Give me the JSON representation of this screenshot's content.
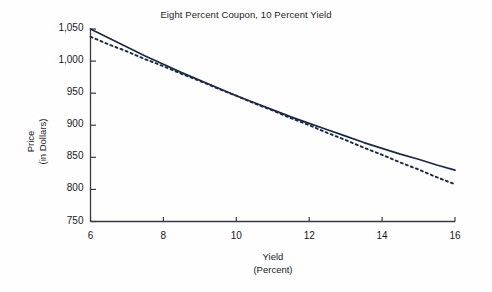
{
  "chart_data": {
    "type": "line",
    "title": "Eight Percent Coupon, 10 Percent Yield",
    "xlabel_line1": "Yield",
    "xlabel_line2": "(Percent)",
    "ylabel_line1": "Price",
    "ylabel_line2": "(in Dollars)",
    "xlim": [
      6,
      16
    ],
    "ylim": [
      750,
      1050
    ],
    "grid": false,
    "legend": "none",
    "xticks": [
      6,
      8,
      10,
      12,
      14,
      16
    ],
    "xtick_labels": [
      "6",
      "8",
      "10",
      "12",
      "14",
      "16"
    ],
    "yticks": [
      750,
      800,
      850,
      900,
      950,
      1000,
      1050
    ],
    "ytick_labels": [
      "750",
      "800",
      "850",
      "900",
      "950",
      "1,000",
      "1,050"
    ],
    "series": [
      {
        "name": "price-yield-curve",
        "style": "solid",
        "color": "#1b2a44",
        "x": [
          6,
          6.5,
          7,
          7.5,
          8,
          8.5,
          9,
          9.5,
          10,
          10.5,
          11,
          11.5,
          12,
          12.5,
          13,
          13.5,
          14,
          14.5,
          15,
          15.5,
          16
        ],
        "y": [
          1050,
          1036,
          1022,
          1008,
          995,
          982,
          970,
          958,
          946,
          935,
          924,
          913,
          903,
          893,
          883,
          873,
          864,
          855,
          847,
          838,
          830
        ]
      },
      {
        "name": "duration-approximation",
        "style": "dashed",
        "color": "#1b2a44",
        "x": [
          6,
          6.5,
          7,
          7.5,
          8,
          8.5,
          9,
          9.5,
          10,
          10.5,
          11,
          11.5,
          12,
          12.5,
          13,
          13.5,
          14,
          14.5,
          15,
          15.5,
          16
        ],
        "y": [
          1038,
          1026,
          1015,
          1003,
          992,
          980,
          969,
          957,
          946,
          934,
          923,
          911,
          900,
          888,
          877,
          865,
          854,
          842,
          831,
          819,
          808
        ]
      }
    ],
    "annotations": []
  },
  "colors": {
    "axis": "#3a3a44",
    "line": "#1b2a44",
    "text": "#18181c",
    "background": "#fefefe"
  }
}
